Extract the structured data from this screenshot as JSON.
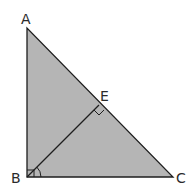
{
  "diagram": {
    "colors": {
      "fill": "#b5b5b5",
      "stroke": "#1e1e1e",
      "background": "#ffffff",
      "label": "#2a2a2a"
    },
    "points": {
      "A": {
        "label": "A",
        "x": 27,
        "y": 28
      },
      "B": {
        "label": "B",
        "x": 27,
        "y": 177
      },
      "C": {
        "label": "C",
        "x": 173,
        "y": 177
      },
      "E": {
        "label": "E",
        "x": 99,
        "y": 105
      }
    },
    "segments": [
      "AB",
      "BC",
      "CA",
      "BE"
    ],
    "right_angles": [
      "B",
      "E"
    ],
    "angle_marks": [
      "EBC"
    ]
  }
}
